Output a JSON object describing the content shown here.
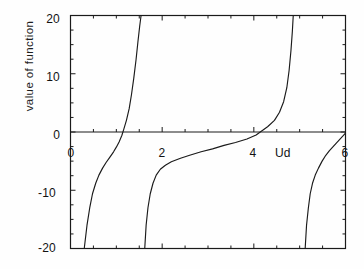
{
  "chart_data": {
    "type": "line",
    "title": "",
    "xlabel": "Ud",
    "ylabel": "value of function",
    "xlim": [
      0,
      6
    ],
    "ylim": [
      -20,
      20
    ],
    "grid": false,
    "legend": null,
    "xticks": [
      0,
      2,
      4,
      6
    ],
    "xtick_labels": [
      "0",
      "2",
      "4",
      "6"
    ],
    "yticks": [
      -20,
      -10,
      0,
      10,
      20
    ],
    "ytick_labels": [
      "-20",
      "-10",
      "0",
      "10",
      "20"
    ],
    "x_minor_tick_step": 0.5,
    "y_minor_tick_step": 2.5,
    "zero_line": true,
    "asymptotes": [
      1.55,
      4.8,
      5.05
    ],
    "zero_crossings": [
      1.12,
      4.12,
      6.0
    ],
    "series": [
      {
        "name": "branch-1",
        "comment": "rising branch from -20 up through zero crossing to +20, asymptote at x=1.55",
        "points": [
          [
            0.3,
            -20.0
          ],
          [
            0.36,
            -16.0
          ],
          [
            0.42,
            -13.0
          ],
          [
            0.48,
            -10.6
          ],
          [
            0.55,
            -8.8
          ],
          [
            0.62,
            -7.4
          ],
          [
            0.7,
            -6.2
          ],
          [
            0.78,
            -5.2
          ],
          [
            0.86,
            -4.3
          ],
          [
            0.94,
            -3.4
          ],
          [
            1.0,
            -2.6
          ],
          [
            1.06,
            -1.7
          ],
          [
            1.12,
            -0.6
          ],
          [
            1.16,
            0.4
          ],
          [
            1.22,
            2.0
          ],
          [
            1.28,
            4.0
          ],
          [
            1.33,
            6.4
          ],
          [
            1.38,
            9.2
          ],
          [
            1.43,
            12.4
          ],
          [
            1.47,
            15.4
          ],
          [
            1.51,
            18.2
          ],
          [
            1.54,
            20.0
          ]
        ]
      },
      {
        "name": "branch-2",
        "comment": "rising branch from -20 at x=1.62 flattening toward +1 near x=4.2",
        "points": [
          [
            1.62,
            -20.0
          ],
          [
            1.65,
            -16.0
          ],
          [
            1.69,
            -13.0
          ],
          [
            1.74,
            -10.6
          ],
          [
            1.8,
            -8.8
          ],
          [
            1.87,
            -7.4
          ],
          [
            1.96,
            -6.4
          ],
          [
            2.07,
            -5.7
          ],
          [
            2.2,
            -5.1
          ],
          [
            2.4,
            -4.5
          ],
          [
            2.6,
            -4.0
          ],
          [
            2.85,
            -3.4
          ],
          [
            3.1,
            -2.9
          ],
          [
            3.35,
            -2.3
          ],
          [
            3.6,
            -1.8
          ],
          [
            3.85,
            -1.2
          ],
          [
            4.05,
            -0.5
          ],
          [
            4.14,
            0.0
          ],
          [
            4.3,
            0.9
          ],
          [
            4.45,
            2.0
          ],
          [
            4.56,
            3.4
          ],
          [
            4.65,
            5.2
          ],
          [
            4.72,
            7.6
          ],
          [
            4.77,
            10.6
          ],
          [
            4.81,
            14.0
          ],
          [
            4.84,
            17.2
          ],
          [
            4.86,
            20.0
          ]
        ]
      },
      {
        "name": "branch-3",
        "comment": "rising branch from -20 at x=5.12 toward 0 at right edge x=6",
        "points": [
          [
            5.12,
            -20.0
          ],
          [
            5.15,
            -16.0
          ],
          [
            5.19,
            -13.0
          ],
          [
            5.23,
            -10.6
          ],
          [
            5.28,
            -8.8
          ],
          [
            5.34,
            -7.4
          ],
          [
            5.41,
            -6.2
          ],
          [
            5.49,
            -5.0
          ],
          [
            5.57,
            -4.0
          ],
          [
            5.65,
            -3.2
          ],
          [
            5.73,
            -2.5
          ],
          [
            5.8,
            -1.9
          ],
          [
            5.87,
            -1.3
          ],
          [
            5.93,
            -0.8
          ],
          [
            6.0,
            -0.2
          ]
        ]
      }
    ]
  },
  "axes": {
    "frame_color": "#1a1a1a",
    "curve_color": "#1a1a1a"
  }
}
